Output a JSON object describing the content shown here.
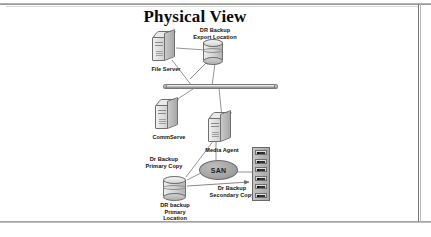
{
  "diagram": {
    "title": "Physical View",
    "type": "network-topology",
    "nodes": [
      {
        "id": "file-server",
        "label": "File Server",
        "shape": "server"
      },
      {
        "id": "export-location",
        "label": "DR Backup\nExport Location",
        "shape": "cylinder"
      },
      {
        "id": "commserve",
        "label": "CommServe",
        "shape": "server"
      },
      {
        "id": "media-agent",
        "label": "Media Agent",
        "shape": "server"
      },
      {
        "id": "san",
        "label": "SAN",
        "shape": "ellipse"
      },
      {
        "id": "primary-location",
        "label": "DR backup\nPrimary\nLocation",
        "shape": "cylinder"
      },
      {
        "id": "tape-library",
        "label": "",
        "shape": "rack"
      }
    ],
    "edge_labels": [
      {
        "id": "primary-copy",
        "label": "Dr Backup\nPrimary Copy"
      },
      {
        "id": "secondary-copy",
        "label": "Dr Backup\nSecondary Copy"
      }
    ],
    "network_backbone": {
      "label": ""
    },
    "colors": {
      "line": "#6f6f6f",
      "server_fill": "#e0e0e0",
      "san_fill": "#a6a6a6",
      "text": "#111111"
    }
  }
}
